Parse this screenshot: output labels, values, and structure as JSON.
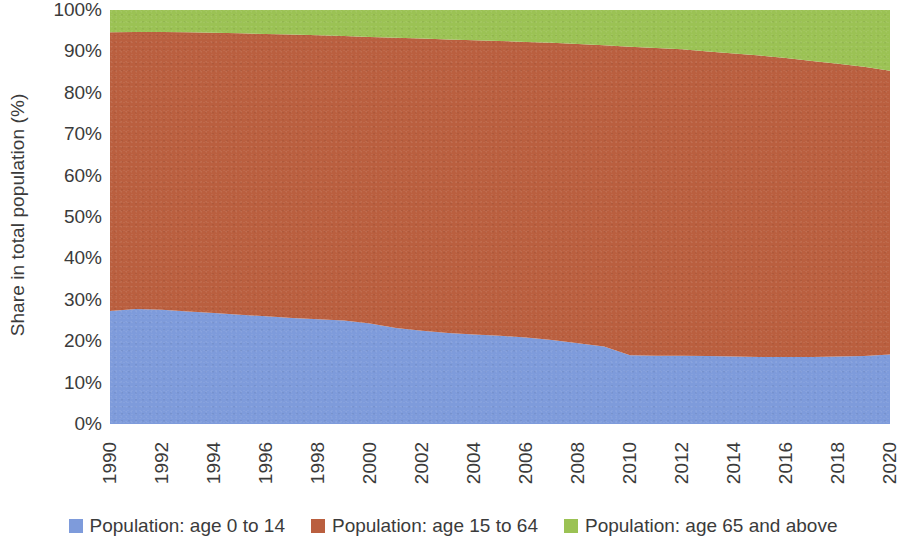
{
  "chart_data": {
    "type": "area",
    "stacked": true,
    "normalized": true,
    "title": "",
    "xlabel": "",
    "ylabel": "Share in total population (%)",
    "ylim": [
      0,
      100
    ],
    "xlim": [
      1990,
      2020
    ],
    "grid": false,
    "legend_position": "bottom",
    "x": [
      1990,
      1991,
      1992,
      1993,
      1994,
      1995,
      1996,
      1997,
      1998,
      1999,
      2000,
      2001,
      2002,
      2003,
      2004,
      2005,
      2006,
      2007,
      2008,
      2009,
      2010,
      2011,
      2012,
      2013,
      2014,
      2015,
      2016,
      2017,
      2018,
      2019,
      2020
    ],
    "categories": [
      "1990",
      "1991",
      "1992",
      "1993",
      "1994",
      "1995",
      "1996",
      "1997",
      "1998",
      "1999",
      "2000",
      "2001",
      "2002",
      "2003",
      "2004",
      "2005",
      "2006",
      "2007",
      "2008",
      "2009",
      "2010",
      "2011",
      "2012",
      "2013",
      "2014",
      "2015",
      "2016",
      "2017",
      "2018",
      "2019",
      "2020"
    ],
    "x_tick_labels": [
      "1990",
      "1992",
      "1994",
      "1996",
      "1998",
      "2000",
      "2002",
      "2004",
      "2006",
      "2008",
      "2010",
      "2012",
      "2014",
      "2016",
      "2018",
      "2020"
    ],
    "y_tick_labels": [
      "0%",
      "10%",
      "20%",
      "30%",
      "40%",
      "50%",
      "60%",
      "70%",
      "80%",
      "90%",
      "100%"
    ],
    "y_ticks": [
      0,
      10,
      20,
      30,
      40,
      50,
      60,
      70,
      80,
      90,
      100
    ],
    "series": [
      {
        "name": "Population: age 0 to 14",
        "color": "#7E9BDB",
        "values": [
          27.3,
          27.8,
          27.6,
          27.2,
          26.8,
          26.4,
          26.0,
          25.6,
          25.3,
          25.0,
          24.3,
          23.2,
          22.5,
          22.0,
          21.6,
          21.3,
          20.9,
          20.3,
          19.5,
          18.7,
          16.6,
          16.5,
          16.5,
          16.4,
          16.3,
          16.2,
          16.2,
          16.2,
          16.3,
          16.4,
          16.8
        ]
      },
      {
        "name": "Population: age 15 to 64",
        "color": "#BA5F3F",
        "values": [
          67.3,
          66.9,
          67.1,
          67.4,
          67.7,
          68.0,
          68.2,
          68.5,
          68.6,
          68.7,
          69.2,
          70.1,
          70.6,
          70.9,
          71.1,
          71.2,
          71.4,
          71.8,
          72.3,
          72.8,
          74.5,
          74.3,
          74.0,
          73.6,
          73.2,
          72.8,
          72.2,
          71.5,
          70.7,
          69.9,
          68.5
        ]
      },
      {
        "name": "Population: age 65 and above",
        "color": "#9BC254",
        "values": [
          5.4,
          5.3,
          5.3,
          5.4,
          5.5,
          5.6,
          5.8,
          5.9,
          6.1,
          6.3,
          6.5,
          6.7,
          6.9,
          7.1,
          7.3,
          7.5,
          7.7,
          7.9,
          8.2,
          8.5,
          8.9,
          9.2,
          9.5,
          10.0,
          10.5,
          11.0,
          11.6,
          12.3,
          13.0,
          13.7,
          14.7
        ]
      }
    ]
  },
  "legend": {
    "items": [
      {
        "label": "Population: age 0 to 14",
        "color": "#7E9BDB"
      },
      {
        "label": "Population: age 15 to 64",
        "color": "#BA5F3F"
      },
      {
        "label": "Population: age 65 and above",
        "color": "#9BC254"
      }
    ]
  },
  "axes": {
    "y_title": "Share in total population (%)"
  }
}
